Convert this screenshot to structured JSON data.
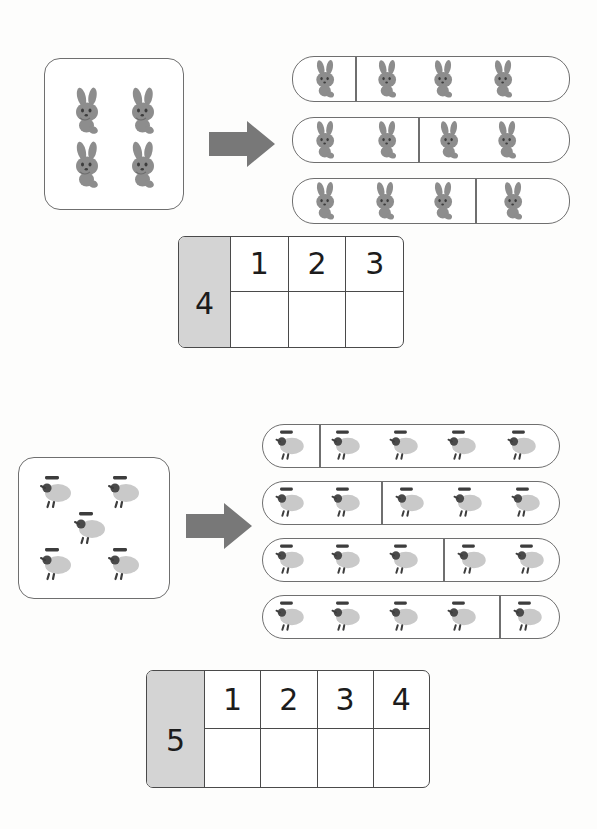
{
  "worksheet": {
    "title": "Number decomposition worksheet",
    "accent_gray": "#d4d4d4",
    "line_color": "#6f6f6f",
    "animal_color": "#8a8a8a"
  },
  "sections": [
    {
      "id": "section-bunnies",
      "total": 4,
      "animal": "bunny-icon",
      "source_count": 4,
      "arrow": "right-arrow-icon",
      "strips": [
        {
          "left": 1,
          "right": 3
        },
        {
          "left": 2,
          "right": 2
        },
        {
          "left": 3,
          "right": 1
        }
      ],
      "table": {
        "total_label": "4",
        "headers": [
          "1",
          "2",
          "3"
        ],
        "answers": [
          "",
          "",
          ""
        ]
      }
    },
    {
      "id": "section-sheep",
      "total": 5,
      "animal": "sheep-icon",
      "source_count": 5,
      "arrow": "right-arrow-icon",
      "strips": [
        {
          "left": 1,
          "right": 4
        },
        {
          "left": 2,
          "right": 3
        },
        {
          "left": 3,
          "right": 2
        },
        {
          "left": 4,
          "right": 1
        }
      ],
      "table": {
        "total_label": "5",
        "headers": [
          "1",
          "2",
          "3",
          "4"
        ],
        "answers": [
          "",
          "",
          "",
          ""
        ]
      }
    }
  ]
}
